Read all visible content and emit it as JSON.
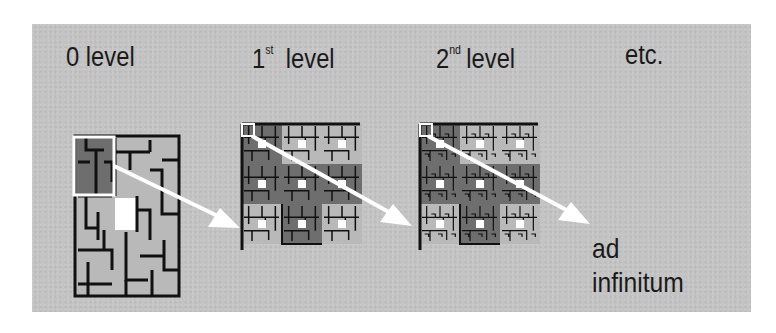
{
  "labels": {
    "level0": "0 level",
    "level1_num": "1",
    "level1_sup": "st",
    "level1_word": "level",
    "level2_num": "2",
    "level2_sup": "nd",
    "level2_word": "level",
    "etc": "etc.",
    "ad": "ad",
    "infinitum": "infinitum"
  },
  "colors": {
    "background": "#c4c4c4",
    "wall": "#111111",
    "cell_light": "#b9b9b9",
    "cell_dark": "#6e6e6e",
    "highlight": "#ffffff",
    "arrow": "#ffffff"
  }
}
